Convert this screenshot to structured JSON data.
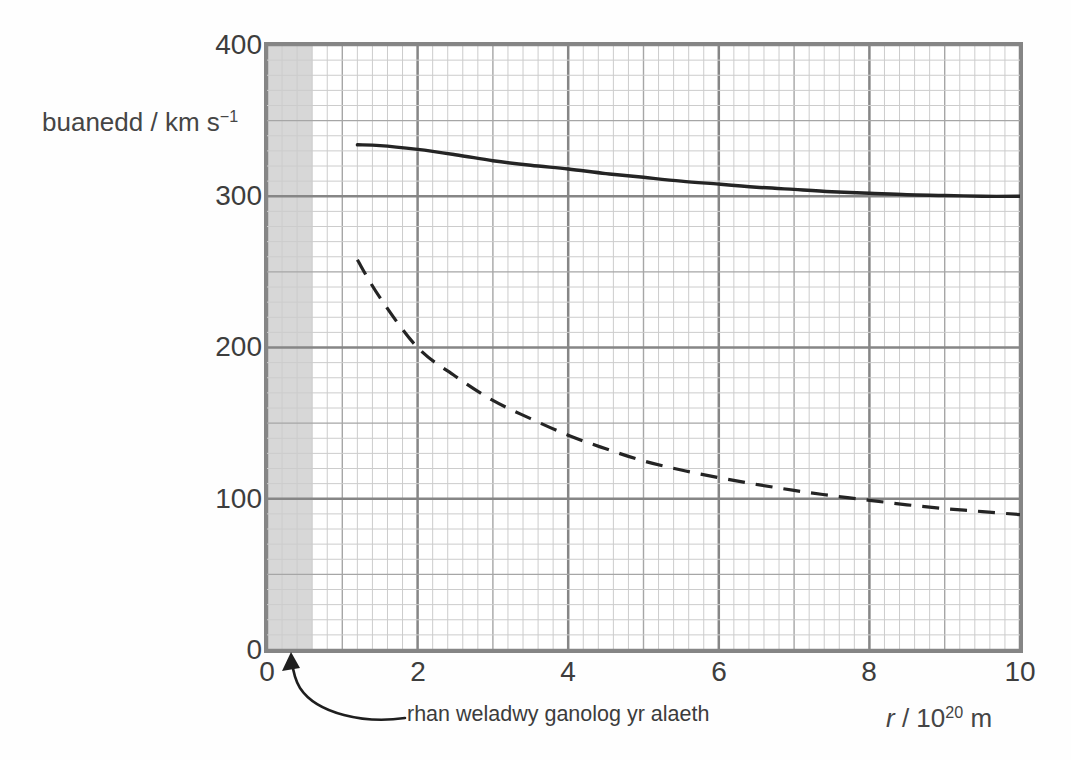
{
  "chart_data": {
    "type": "line",
    "title": "",
    "ylabel": {
      "text": "buanedd / km s",
      "exponent": "−1"
    },
    "xlabel": {
      "variable": "r",
      "separator": " / 10",
      "exponent": "20",
      "unit": " m"
    },
    "xlim": [
      0,
      10
    ],
    "ylim": [
      0,
      400
    ],
    "xtick_values": [
      0,
      2,
      4,
      6,
      8,
      10
    ],
    "ytick_values": [
      400,
      300,
      200,
      100,
      0
    ],
    "xtick_labels": [
      "0",
      "2",
      "4",
      "6",
      "8",
      "10"
    ],
    "ytick_labels": [
      "400",
      "300",
      "200",
      "100",
      "0"
    ],
    "grid": {
      "on": true,
      "x_minor_step": 0.2,
      "x_medium_step": 1,
      "x_major_step": 2,
      "y_minor_step": 10,
      "y_medium_step": 50,
      "y_major_step": 100,
      "minor_color": "#cccccc",
      "medium_color": "#a6a6a6",
      "major_color": "#868686"
    },
    "shaded_region": {
      "x_start": 0,
      "x_end": 0.6,
      "color": "#d7d7d7",
      "label": "rhan weladwy ganolog yr alaeth"
    },
    "series": [
      {
        "name": "solid_curve",
        "line_style": "solid",
        "color": "#242424",
        "points": [
          [
            1.2,
            334
          ],
          [
            1.5,
            333.5
          ],
          [
            2,
            331
          ],
          [
            2.5,
            327.5
          ],
          [
            3,
            323.5
          ],
          [
            3.5,
            320.5
          ],
          [
            4,
            318
          ],
          [
            4.5,
            315
          ],
          [
            5,
            312.5
          ],
          [
            5.5,
            310
          ],
          [
            6,
            308
          ],
          [
            6.5,
            306
          ],
          [
            7,
            304.5
          ],
          [
            7.5,
            303
          ],
          [
            8,
            302
          ],
          [
            8.5,
            301
          ],
          [
            9,
            300.5
          ],
          [
            9.5,
            300
          ],
          [
            10,
            300
          ]
        ]
      },
      {
        "name": "dashed_curve",
        "line_style": "dashed",
        "color": "#242424",
        "points": [
          [
            1.2,
            258
          ],
          [
            1.5,
            233
          ],
          [
            2,
            200
          ],
          [
            2.5,
            181
          ],
          [
            3,
            165
          ],
          [
            3.5,
            153
          ],
          [
            4,
            142
          ],
          [
            4.5,
            133
          ],
          [
            5,
            125
          ],
          [
            5.5,
            119
          ],
          [
            6,
            114
          ],
          [
            6.5,
            109.5
          ],
          [
            7,
            105.5
          ],
          [
            7.5,
            102
          ],
          [
            8,
            99
          ],
          [
            8.5,
            96
          ],
          [
            9,
            93.5
          ],
          [
            9.5,
            91.5
          ],
          [
            10,
            89.5
          ]
        ]
      }
    ]
  }
}
